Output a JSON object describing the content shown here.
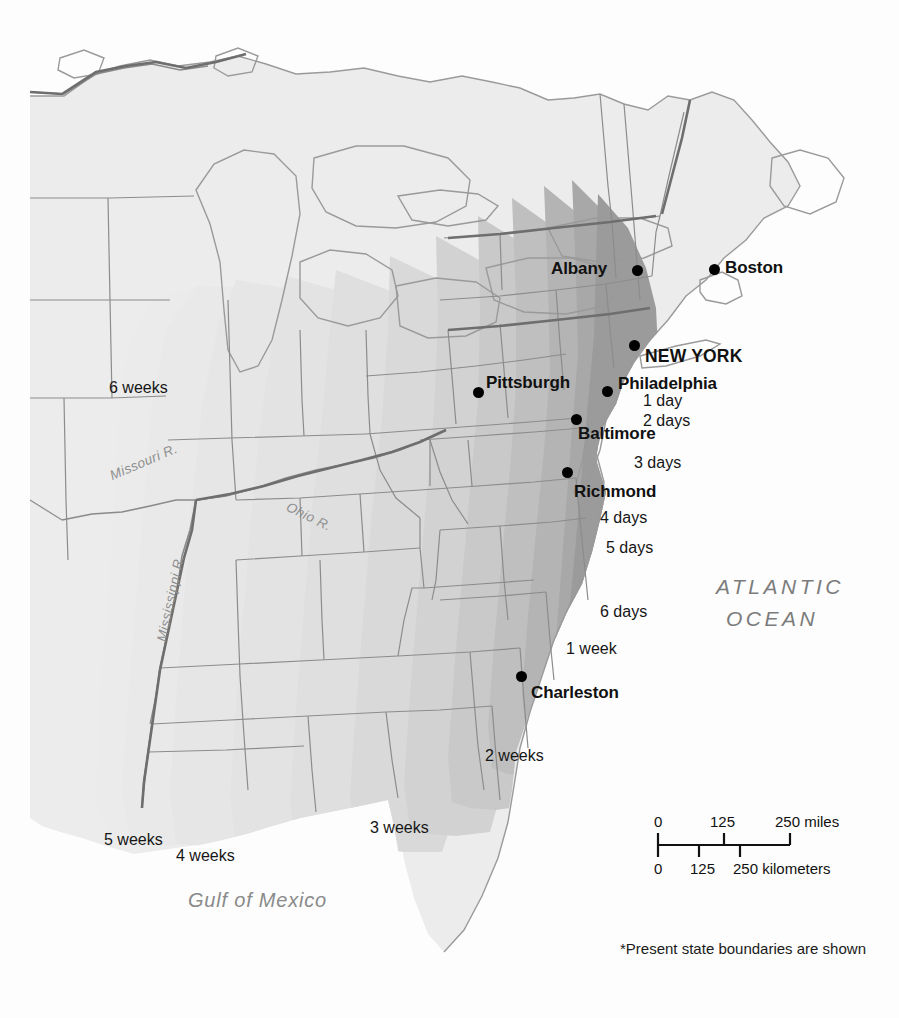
{
  "map": {
    "title": "Travel time from New York",
    "footnote": "*Present state boundaries are shown",
    "background_color": "#fdfdfd",
    "land_color": "#ececec",
    "border_color": "#8c8c8c",
    "coast_color": "#9a9a9a"
  },
  "water_labels": {
    "atlantic_line1": "ATLANTIC",
    "atlantic_line2": "OCEAN",
    "gulf": "Gulf of Mexico"
  },
  "rivers": [
    {
      "name": "Missouri R.",
      "x": 108,
      "y": 470,
      "rotate": -23
    },
    {
      "name": "Ohio R.",
      "x": 290,
      "y": 500,
      "rotate": 26
    },
    {
      "name": "Mississippi R.",
      "x": 155,
      "y": 640,
      "rotate": -78
    }
  ],
  "cities": [
    {
      "name": "Albany",
      "dot_x": 637,
      "dot_y": 270,
      "label_x": 551,
      "label_y": 260,
      "capital": false
    },
    {
      "name": "Boston",
      "dot_x": 714,
      "dot_y": 269,
      "label_x": 725,
      "label_y": 259,
      "capital": false
    },
    {
      "name": "NEW YORK",
      "dot_x": 634,
      "dot_y": 345,
      "label_x": 645,
      "label_y": 348,
      "capital": true
    },
    {
      "name": "Philadelphia",
      "dot_x": 607,
      "dot_y": 391,
      "label_x": 618,
      "label_y": 375,
      "capital": false
    },
    {
      "name": "Pittsburgh",
      "dot_x": 478,
      "dot_y": 392,
      "label_x": 486,
      "label_y": 374,
      "capital": false
    },
    {
      "name": "Baltimore",
      "dot_x": 576,
      "dot_y": 419,
      "label_x": 578,
      "label_y": 425,
      "capital": false
    },
    {
      "name": "Richmond",
      "dot_x": 567,
      "dot_y": 472,
      "label_x": 574,
      "label_y": 483,
      "capital": false
    },
    {
      "name": "Charleston",
      "dot_x": 521,
      "dot_y": 676,
      "label_x": 531,
      "label_y": 684,
      "capital": false
    }
  ],
  "isochrones": [
    {
      "label": "1 day",
      "x": 643,
      "y": 393,
      "shade": "#9b9b9b"
    },
    {
      "label": "2 days",
      "x": 643,
      "y": 413,
      "shade": "#a8a8a8"
    },
    {
      "label": "3 days",
      "x": 634,
      "y": 455,
      "shade": "#b4b4b4"
    },
    {
      "label": "4 days",
      "x": 600,
      "y": 510,
      "shade": "#bfbfbf"
    },
    {
      "label": "5 days",
      "x": 606,
      "y": 540,
      "shade": "#c9c9c9"
    },
    {
      "label": "6 days",
      "x": 600,
      "y": 604,
      "shade": "#d2d2d2"
    },
    {
      "label": "1 week",
      "x": 566,
      "y": 641,
      "shade": "#d9d9d9"
    },
    {
      "label": "2 weeks",
      "x": 485,
      "y": 748,
      "shade": "#dfdfdf"
    },
    {
      "label": "3 weeks",
      "x": 370,
      "y": 820,
      "shade": "#e3e3e3"
    },
    {
      "label": "4 weeks",
      "x": 176,
      "y": 848,
      "shade": "#e6e6e6"
    },
    {
      "label": "5 weeks",
      "x": 104,
      "y": 832,
      "shade": "#e9e9e9"
    },
    {
      "label": "6 weeks",
      "x": 109,
      "y": 380,
      "shade": "#ebebeb"
    }
  ],
  "scale": {
    "miles_ticks": [
      "0",
      "125",
      "250 miles"
    ],
    "km_ticks": [
      "0",
      "125",
      "250 kilometers"
    ],
    "bar_left": 658,
    "bar_right": 790,
    "bar_y": 845
  },
  "chart_data": {
    "type": "map",
    "units": "days / weeks of travel",
    "origin": "NEW YORK",
    "contours": [
      {
        "label": "1 day",
        "value_days": 1
      },
      {
        "label": "2 days",
        "value_days": 2
      },
      {
        "label": "3 days",
        "value_days": 3
      },
      {
        "label": "4 days",
        "value_days": 4
      },
      {
        "label": "5 days",
        "value_days": 5
      },
      {
        "label": "6 days",
        "value_days": 6
      },
      {
        "label": "1 week",
        "value_days": 7
      },
      {
        "label": "2 weeks",
        "value_days": 14
      },
      {
        "label": "3 weeks",
        "value_days": 21
      },
      {
        "label": "4 weeks",
        "value_days": 28
      },
      {
        "label": "5 weeks",
        "value_days": 35
      },
      {
        "label": "6 weeks",
        "value_days": 42
      }
    ]
  }
}
